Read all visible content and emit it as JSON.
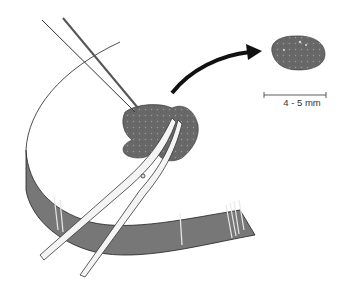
{
  "figure": {
    "scale_bar": {
      "label": "4 - 5 mm"
    },
    "colors": {
      "tissue": "#6b6b6b",
      "band": "#7a7a7a",
      "outline": "#222222",
      "arrow": "#111111",
      "background": "#ffffff"
    },
    "elements": [
      {
        "name": "specimen-disc",
        "label": "Circular specimen"
      },
      {
        "name": "forceps",
        "label": "Forceps"
      },
      {
        "name": "scissors",
        "label": "Scissors"
      },
      {
        "name": "tissue-fragment",
        "label": "Tissue fragment being excised"
      },
      {
        "name": "excised-sample",
        "label": "Excised sample"
      },
      {
        "name": "direction-arrow",
        "label": "Curved arrow"
      }
    ]
  }
}
